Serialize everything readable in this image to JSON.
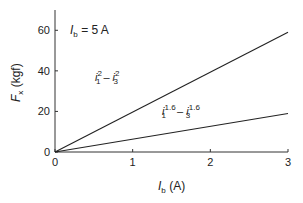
{
  "chart_data": {
    "type": "line",
    "title": "",
    "xlabel": "I_b (A)",
    "ylabel": "F_x (kgf)",
    "xlim": [
      0,
      3
    ],
    "ylim": [
      0,
      70
    ],
    "xticks": [
      "0",
      "1",
      "2",
      "3"
    ],
    "yticks": [
      "0",
      "20",
      "40",
      "60"
    ],
    "grid": false,
    "annotations": [
      "I_b = 5 A",
      "i1^2 - i3^2",
      "i1^1.6 - i3^1.6"
    ],
    "series": [
      {
        "name": "i1^2 - i3^2",
        "x": [
          0,
          3
        ],
        "y": [
          0,
          59
        ]
      },
      {
        "name": "i1^1.6 - i3^1.6",
        "x": [
          0,
          3
        ],
        "y": [
          0,
          19
        ]
      }
    ]
  },
  "labels": {
    "xlabel_main": "I",
    "xlabel_sub": "b",
    "xlabel_unit": " (A)",
    "ylabel_main": "F",
    "ylabel_sub": "x",
    "ylabel_unit": " (kgf)",
    "ib_main": "I",
    "ib_sub": "b",
    "ib_val": " = 5 A",
    "s1_a": "i",
    "s1_a_sub": "1",
    "s1_a_sup": "2",
    "s1_minus": " – ",
    "s1_b": "i",
    "s1_b_sub": "3",
    "s1_b_sup": "2",
    "s2_a": "i",
    "s2_a_sub": "1",
    "s2_a_sup": "1.6",
    "s2_minus": " – ",
    "s2_b": "i",
    "s2_b_sub": "3",
    "s2_b_sup": "1.6"
  }
}
